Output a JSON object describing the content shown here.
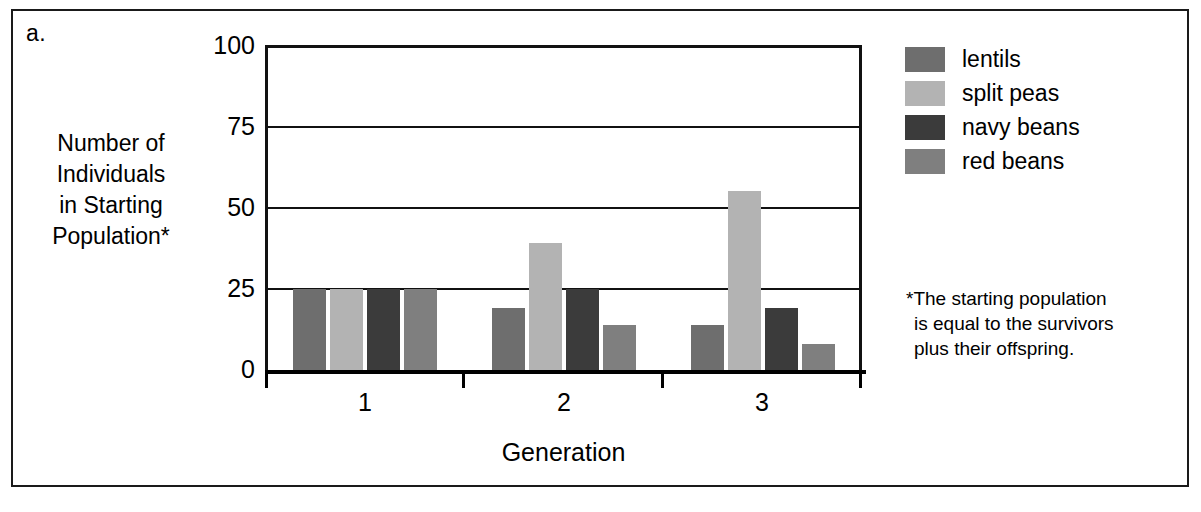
{
  "panel_letter": "a.",
  "axis": {
    "y_title_lines": [
      "Number of",
      "Individuals",
      "in Starting",
      "Population*"
    ],
    "x_title": "Generation",
    "y_ticks": [
      "0",
      "25",
      "50",
      "75",
      "100"
    ]
  },
  "legend": {
    "items": [
      {
        "label": "lentils",
        "color": "#6e6e6e"
      },
      {
        "label": "split peas",
        "color": "#b3b3b3"
      },
      {
        "label": "navy beans",
        "color": "#3b3b3b"
      },
      {
        "label": "red beans",
        "color": "#7f7f7f"
      }
    ]
  },
  "footnote": {
    "lines": [
      "*The starting population",
      "is equal to the survivors",
      "plus their offspring."
    ]
  },
  "chart_data": {
    "type": "bar",
    "title": "",
    "xlabel": "Generation",
    "ylabel": "Number of Individuals in Starting Population*",
    "categories": [
      "1",
      "2",
      "3"
    ],
    "ylim": [
      0,
      100
    ],
    "yticks": [
      0,
      25,
      50,
      75,
      100
    ],
    "grid": true,
    "legend_position": "right",
    "series": [
      {
        "name": "lentils",
        "color": "#6e6e6e",
        "values": [
          25,
          19,
          14
        ]
      },
      {
        "name": "split peas",
        "color": "#b3b3b3",
        "values": [
          25,
          39,
          55
        ]
      },
      {
        "name": "navy beans",
        "color": "#3b3b3b",
        "values": [
          25,
          25,
          19
        ]
      },
      {
        "name": "red beans",
        "color": "#7f7f7f",
        "values": [
          25,
          14,
          8
        ]
      }
    ],
    "annotations": [
      "*The starting population is equal to the survivors plus their offspring."
    ]
  }
}
